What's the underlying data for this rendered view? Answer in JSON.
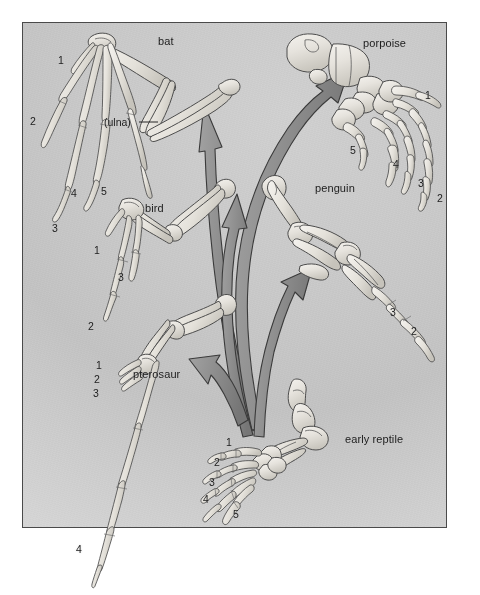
{
  "figure": {
    "background_color": "#c8c8c8",
    "frame_color": "#4a4a4a",
    "bone_fill": "#ebe9e4",
    "bone_outline": "#4c4c4c",
    "arrow_fill": "#8e8e8e",
    "arrow_outline": "#3d3d3d",
    "page_color": "#ffffff"
  },
  "specimens": [
    {
      "id": "bat",
      "label": "bat",
      "digits": [
        "1",
        "2",
        "3",
        "4",
        "5"
      ],
      "bone_labels": [
        "(ulna)"
      ]
    },
    {
      "id": "porpoise",
      "label": "porpoise",
      "digits": [
        "1",
        "2",
        "3",
        "4",
        "5"
      ],
      "bone_labels": []
    },
    {
      "id": "bird",
      "label": "bird",
      "digits": [
        "1",
        "2",
        "3"
      ],
      "bone_labels": []
    },
    {
      "id": "penguin",
      "label": "penguin",
      "digits": [
        "2",
        "3"
      ],
      "bone_labels": []
    },
    {
      "id": "pterosaur",
      "label": "pterosaur",
      "digits": [
        "1",
        "2",
        "3",
        "4"
      ],
      "bone_labels": []
    },
    {
      "id": "early-reptile",
      "label": "early reptile",
      "digits": [
        "1",
        "2",
        "3",
        "4",
        "5"
      ],
      "bone_labels": []
    }
  ],
  "labels": {
    "bat": "bat",
    "porpoise": "porpoise",
    "bird": "bird",
    "penguin": "penguin",
    "pterosaur": "pterosaur",
    "early_reptile": "early reptile",
    "ulna": "(ulna)",
    "bat_d1": "1",
    "bat_d2": "2",
    "bat_d3": "3",
    "bat_d4": "4",
    "bat_d5": "5",
    "porpoise_d1": "1",
    "porpoise_d2": "2",
    "porpoise_d3": "3",
    "porpoise_d4": "4",
    "porpoise_d5": "5",
    "bird_d1": "1",
    "bird_d2": "2",
    "bird_d3": "3",
    "penguin_d2": "2",
    "penguin_d3": "3",
    "pterosaur_d1": "1",
    "pterosaur_d2": "2",
    "pterosaur_d3": "3",
    "pterosaur_d4": "4",
    "reptile_d1": "1",
    "reptile_d2": "2",
    "reptile_d3": "3",
    "reptile_d4": "4",
    "reptile_d5": "5"
  },
  "arrows": {
    "count": 5,
    "origin": "early reptile",
    "targets": [
      "bat",
      "porpoise",
      "bird",
      "penguin",
      "pterosaur"
    ]
  }
}
